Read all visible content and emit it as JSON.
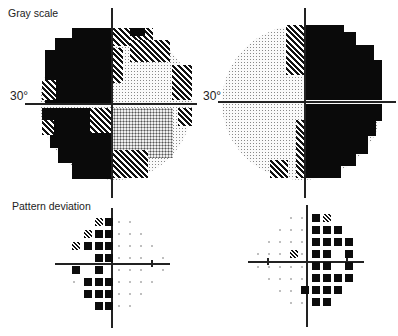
{
  "labels": {
    "gray_scale": "Gray scale",
    "pattern_deviation": "Pattern deviation",
    "degree_left": "30°",
    "degree_right": "30°"
  },
  "colors": {
    "black": "#0a0a0a",
    "light": "#f2f2f2",
    "axis": "#222222"
  },
  "gray_scale_plots": [
    {
      "eye": "left",
      "center": [
        113,
        104
      ],
      "radius_px": 75,
      "dark_region": "left hemifield (superior and inferior nasal/temporal loss)"
    },
    {
      "eye": "right",
      "center": [
        305,
        102
      ],
      "radius_px": 75,
      "dark_region": "right hemifield"
    }
  ],
  "pattern_deviation_plots": [
    {
      "eye": "left",
      "center": [
        111,
        264
      ]
    },
    {
      "eye": "right",
      "center": [
        308,
        262
      ]
    }
  ]
}
